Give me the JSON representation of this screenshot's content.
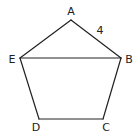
{
  "diagram": {
    "type": "pentagon",
    "stroke_color": "#222222",
    "vertices": [
      {
        "label": "A",
        "x": 71,
        "y": 20,
        "lx": 71,
        "ly": 15
      },
      {
        "label": "B",
        "x": 121,
        "y": 58,
        "lx": 129,
        "ly": 63
      },
      {
        "label": "C",
        "x": 103,
        "y": 119,
        "lx": 106,
        "ly": 131
      },
      {
        "label": "D",
        "x": 39,
        "y": 119,
        "lx": 36,
        "ly": 131
      },
      {
        "label": "E",
        "x": 20,
        "y": 58,
        "lx": 12,
        "ly": 63
      }
    ],
    "segments": [
      [
        "A",
        "B"
      ],
      [
        "B",
        "C"
      ],
      [
        "C",
        "D"
      ],
      [
        "D",
        "E"
      ],
      [
        "E",
        "A"
      ],
      [
        "E",
        "B"
      ]
    ],
    "side_labels": [
      {
        "text": "4",
        "between": [
          "A",
          "B"
        ],
        "x": 100,
        "y": 34
      }
    ]
  }
}
